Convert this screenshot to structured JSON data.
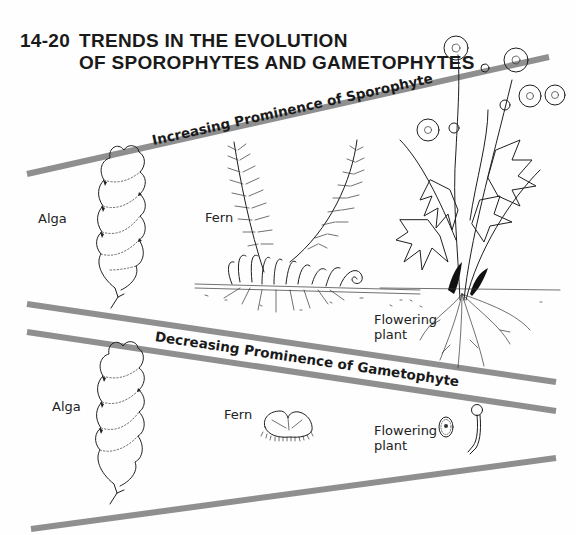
{
  "figure": {
    "number": "14-20",
    "title_line1": "TRENDS IN THE EVOLUTION",
    "title_line2": "OF SPOROPHYTES AND GAMETOPHYTES"
  },
  "colors": {
    "band": "#8f8f8f",
    "ink": "#1e1e1e",
    "background": "#fefefe"
  },
  "sporophyte_panel": {
    "heading": "Increasing Prominence of Sporophyte",
    "organisms": [
      {
        "label": "Alga",
        "icon": "alga-sporophyte-illustration"
      },
      {
        "label": "Fern",
        "icon": "fern-sporophyte-illustration"
      },
      {
        "label_line1": "Flowering",
        "label_line2": "plant",
        "icon": "flowering-plant-sporophyte-illustration"
      }
    ]
  },
  "gametophyte_panel": {
    "heading": "Decreasing Prominence of Gametophyte",
    "organisms": [
      {
        "label": "Alga",
        "icon": "alga-gametophyte-illustration"
      },
      {
        "label": "Fern",
        "icon": "fern-prothallus-illustration"
      },
      {
        "label_line1": "Flowering",
        "label_line2": "plant",
        "icon": "pollen-grain-illustration"
      }
    ]
  }
}
